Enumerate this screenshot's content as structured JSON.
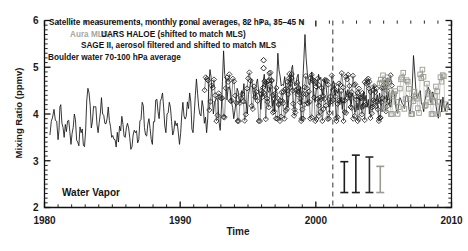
{
  "chart_data": {
    "type": "line",
    "title": "",
    "xlabel": "Time",
    "ylabel": "Mixing Ratio (ppmv)",
    "xlim": [
      1980,
      2010
    ],
    "ylim": [
      2,
      6
    ],
    "xticks": [
      1980,
      1990,
      2000,
      2010
    ],
    "yticks": [
      2,
      3,
      4,
      5,
      6
    ],
    "minor_ticks": true,
    "grid": false,
    "legend_position": "top-left-inside",
    "annotations": [
      {
        "name": "header-line-1",
        "text": "Satellite measurements, monthly zonal averages, 82 hPa, 35–45 N",
        "color": "#141414"
      },
      {
        "name": "header-line-2-aura",
        "text": "Aura MLS,",
        "color": "#a8a79c"
      },
      {
        "name": "header-line-2-haloe",
        "text": "UARS HALOE (shifted to match MLS)",
        "color": "#141414"
      },
      {
        "name": "header-line-3",
        "text": "SAGE II, aerosol filtered and shifted to match MLS",
        "color": "#141414"
      },
      {
        "name": "header-line-4",
        "text": "Boulder water 70-100 hPa average",
        "color": "#141414"
      },
      {
        "name": "water-vapor-label",
        "text": "Water Vapor",
        "color": "#141414"
      }
    ],
    "series": [
      {
        "name": "Boulder water 70-100 hPa average",
        "style": "solid-line",
        "color": "#141414",
        "x": [
          1980.4,
          1980.7,
          1981.0,
          1981.2,
          1981.45,
          1981.7,
          1981.95,
          1982.2,
          1982.45,
          1982.7,
          1982.95,
          1983.2,
          1983.45,
          1983.7,
          1983.95,
          1984.2,
          1984.45,
          1984.7,
          1984.95,
          1985.2,
          1985.45,
          1985.7,
          1985.95,
          1986.2,
          1986.45,
          1986.7,
          1986.95,
          1987.2,
          1987.45,
          1987.7,
          1987.95,
          1988.2,
          1988.45,
          1988.7,
          1988.95,
          1989.2,
          1989.45,
          1989.7,
          1989.95,
          1990.2,
          1990.45,
          1990.7,
          1990.95,
          1991.2,
          1991.45,
          1991.7,
          1991.95,
          1992.2,
          1992.45,
          1992.7,
          1992.95,
          1993.2,
          1993.45,
          1993.7,
          1993.95,
          1994.2,
          1994.45,
          1994.7,
          1994.95,
          1995.2,
          1995.45,
          1995.7,
          1995.95,
          1996.2,
          1996.45,
          1996.7,
          1996.95,
          1997.2,
          1997.45,
          1997.7,
          1997.95,
          1998.2,
          1998.45,
          1998.7,
          1998.95,
          1999.2,
          1999.45,
          1999.7,
          1999.95,
          2000.2,
          2000.45,
          2000.7,
          2000.95,
          2001.2,
          2001.45,
          2001.7,
          2001.95,
          2002.2,
          2002.45,
          2002.7,
          2002.95,
          2003.2,
          2003.45,
          2003.7,
          2003.95,
          2004.2,
          2004.45,
          2004.7,
          2004.95,
          2005.2,
          2005.45,
          2005.7,
          2005.95,
          2006.2,
          2006.45,
          2006.7,
          2006.95,
          2007.2,
          2007.45,
          2007.7,
          2007.95,
          2008.2,
          2008.45,
          2008.7,
          2008.95,
          2009.2,
          2009.45,
          2009.7
        ],
        "y": [
          3.55,
          4.1,
          3.45,
          4.2,
          3.5,
          3.85,
          3.35,
          4.0,
          3.4,
          3.6,
          3.3,
          4.55,
          3.7,
          4.15,
          3.6,
          4.35,
          3.8,
          4.15,
          3.5,
          3.45,
          3.4,
          3.95,
          3.5,
          3.7,
          3.3,
          3.6,
          3.45,
          4.25,
          3.55,
          3.9,
          3.35,
          4.3,
          3.9,
          4.45,
          3.6,
          4.25,
          3.55,
          3.75,
          3.35,
          4.25,
          3.95,
          4.45,
          3.6,
          4.75,
          4.0,
          4.15,
          3.6,
          4.95,
          4.0,
          4.35,
          3.65,
          5.35,
          4.3,
          4.5,
          3.9,
          4.55,
          4.25,
          4.65,
          4.0,
          4.7,
          4.35,
          4.75,
          4.1,
          4.85,
          4.5,
          4.45,
          4.05,
          5.3,
          4.6,
          4.8,
          4.15,
          4.95,
          4.6,
          4.85,
          4.2,
          5.7,
          4.65,
          4.9,
          4.25,
          4.85,
          4.5,
          4.7,
          4.15,
          4.6,
          4.4,
          4.55,
          4.1,
          4.5,
          4.3,
          4.45,
          4.05,
          4.35,
          4.2,
          4.4,
          4.0,
          4.55,
          4.3,
          4.45,
          4.1,
          4.4,
          4.2,
          4.5,
          4.05,
          4.35,
          4.2,
          4.4,
          4.0,
          5.25,
          4.35,
          4.5,
          4.05,
          4.45,
          4.25,
          4.35,
          4.0,
          4.3,
          4.15,
          4.25
        ]
      },
      {
        "name": "UARS HALOE (shifted to match MLS)",
        "style": "open-diamond-markers",
        "color": "#1c1c1c",
        "x_range": [
          1991.8,
          2005.6
        ],
        "n_points": 160,
        "y_mean": 4.35,
        "y_range": [
          3.85,
          5.25
        ]
      },
      {
        "name": "SAGE II, aerosol filtered and shifted to match MLS",
        "style": "open-diamond-markers",
        "color": "#1c1c1c",
        "x_range": [
          1996.0,
          2005.4
        ],
        "n_points": 90,
        "y_mean": 4.3,
        "y_range": [
          3.9,
          5.15
        ]
      },
      {
        "name": "Aura MLS",
        "style": "open-square-markers-gray",
        "color": "#9b9b93",
        "x_range": [
          2004.7,
          2009.6
        ],
        "n_points": 60,
        "y_mean": 4.4,
        "y_range": [
          4.0,
          4.95
        ]
      }
    ],
    "isolated_markers": [
      {
        "x": 1996.15,
        "y": 5.15
      },
      {
        "x": 1996.15,
        "y": 4.98
      },
      {
        "x": 1996.55,
        "y": 4.72
      },
      {
        "x": 2000.2,
        "y": 4.62
      }
    ],
    "error_bars": [
      {
        "x": 2002.1,
        "low": 2.32,
        "high": 2.98,
        "color": "#1c1c1c"
      },
      {
        "x": 2002.95,
        "low": 2.32,
        "high": 3.12,
        "color": "#1c1c1c"
      },
      {
        "x": 2003.95,
        "low": 2.32,
        "high": 3.08,
        "color": "#2a2a2a"
      },
      {
        "x": 2004.75,
        "low": 2.32,
        "high": 2.88,
        "color": "#9b9b93"
      }
    ],
    "vline": {
      "x": 2001.25,
      "style": "dashed",
      "color": "#555555"
    }
  }
}
